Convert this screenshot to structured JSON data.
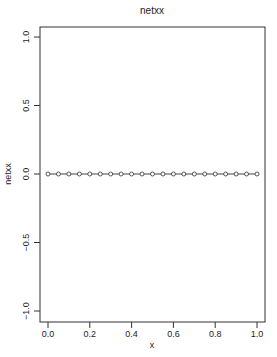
{
  "chart_data": {
    "type": "line",
    "title": "netxx",
    "xlabel": "x",
    "ylabel": "netxx",
    "xlim": [
      -0.04,
      1.04
    ],
    "ylim": [
      -1.08,
      1.08
    ],
    "x_ticks": [
      "0.0",
      "0.2",
      "0.4",
      "0.6",
      "0.8",
      "1.0"
    ],
    "y_ticks": [
      "-1.0",
      "-0.5",
      "0.0",
      "0.5",
      "1.0"
    ],
    "grid": false,
    "legend": null,
    "series": [
      {
        "name": "netxx",
        "marker": "open-circle",
        "line": true,
        "x": [
          0.0,
          0.05,
          0.1,
          0.15,
          0.2,
          0.25,
          0.3,
          0.35,
          0.4,
          0.45,
          0.5,
          0.55,
          0.6,
          0.65,
          0.7,
          0.75,
          0.8,
          0.85,
          0.9,
          0.95,
          1.0
        ],
        "values": [
          0,
          0,
          0,
          0,
          0,
          0,
          0,
          0,
          0,
          0,
          0,
          0,
          0,
          0,
          0,
          0,
          0,
          0,
          0,
          0,
          0
        ]
      }
    ]
  },
  "colors": {
    "axis": "#333333",
    "line": "#444444",
    "marker": "#444444"
  }
}
